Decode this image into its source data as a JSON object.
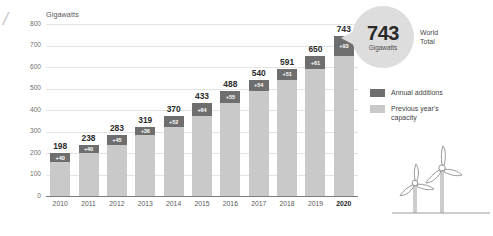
{
  "corner_mark": "/",
  "axis_title": "Gigawatts",
  "callout": {
    "value": "743",
    "unit": "Gigawatts",
    "caption_line1": "World",
    "caption_line2": "Total"
  },
  "legend": {
    "items": [
      {
        "label": "Annual additions",
        "color": "#6e6e6e",
        "swatch": "dark"
      },
      {
        "label": "Previous year's\ncapacity",
        "color": "#c9c9c9",
        "swatch": "light"
      }
    ]
  },
  "colors": {
    "annual_additions": "#6e6e6e",
    "previous_capacity": "#c9c9c9",
    "gridline": "#e3e3e3",
    "axis": "#7d7d7d",
    "callout_fill": "#dddddd"
  },
  "chart_data": {
    "type": "bar",
    "title": "",
    "subtitle": "",
    "xlabel": "",
    "ylabel": "Gigawatts",
    "ylim": [
      0,
      800
    ],
    "yticks": [
      "0",
      "100",
      "200",
      "300",
      "400",
      "500",
      "600",
      "700",
      "800"
    ],
    "grid": true,
    "stacked": true,
    "legend_position": "right",
    "categories": [
      "2010",
      "2011",
      "2012",
      "2013",
      "2014",
      "2015",
      "2016",
      "2017",
      "2018",
      "2019",
      "2020"
    ],
    "values": [
      198,
      238,
      283,
      319,
      370,
      433,
      488,
      540,
      591,
      650,
      743
    ],
    "series": [
      {
        "name": "Previous year's capacity",
        "values": [
          158,
          198,
          238,
          283,
          319,
          370,
          433,
          488,
          540,
          591,
          650
        ]
      },
      {
        "name": "Annual additions",
        "values": [
          40,
          40,
          45,
          36,
          51,
          63,
          55,
          52,
          51,
          59,
          93
        ]
      }
    ],
    "total_labels": [
      "198",
      "238",
      "283",
      "319",
      "370",
      "433",
      "488",
      "540",
      "591",
      "650",
      "743"
    ],
    "addition_labels": [
      "+40",
      "+40",
      "+45",
      "+36",
      "+52",
      "+64",
      "+55",
      "+54",
      "+51",
      "+61",
      "+93"
    ],
    "highlight_category": "2020",
    "annotations": [
      {
        "text": "743",
        "note": "World Total callout bubble pointing at 2020 bar"
      }
    ]
  }
}
